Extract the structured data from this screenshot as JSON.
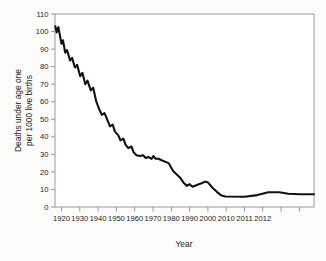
{
  "figure": {
    "y_axis_label_line1": "Deaths under age one",
    "y_axis_label_line2": "per 1000 live births",
    "x_axis_label": "Year"
  },
  "colors": {
    "line": "#121212",
    "axis": "#8f8f8f",
    "plot_background": "#ffffff",
    "text": "#1c1c1c"
  },
  "chart_data": {
    "type": "line",
    "title": "",
    "xlabel": "Year",
    "ylabel": "Deaths under age one per 1000 live births",
    "ylim": [
      0,
      110
    ],
    "y_tick_step": 10,
    "y_ticks": [
      0,
      10,
      20,
      30,
      40,
      50,
      60,
      70,
      80,
      90,
      100,
      110
    ],
    "x_tick_labels": [
      "1920",
      "1930",
      "1940",
      "1950",
      "1960",
      "1970",
      "1980",
      "1990",
      "2000",
      "2010",
      "2011",
      "2012"
    ],
    "extra_unlabeled_x_ticks": 2,
    "legend": "none",
    "grid": "off",
    "axis_note": "decade spacing 1920-2010; final labeled intervals 2011 and 2012 drawn at the same spacing as a decade",
    "points": [
      [
        1916.6,
        103
      ],
      [
        1917.4,
        99.5
      ],
      [
        1918.3,
        102.5
      ],
      [
        1920,
        93
      ],
      [
        1920.8,
        95
      ],
      [
        1922,
        88
      ],
      [
        1923,
        89.5
      ],
      [
        1924.7,
        83.5
      ],
      [
        1925.8,
        85
      ],
      [
        1927.3,
        79.5
      ],
      [
        1928.5,
        81
      ],
      [
        1930.2,
        74.5
      ],
      [
        1931.4,
        76.5
      ],
      [
        1933,
        70
      ],
      [
        1934.2,
        72
      ],
      [
        1936,
        66.5
      ],
      [
        1937.3,
        68
      ],
      [
        1939,
        60
      ],
      [
        1940.5,
        56
      ],
      [
        1942,
        52.5
      ],
      [
        1943.5,
        53.5
      ],
      [
        1945.5,
        48.5
      ],
      [
        1946.5,
        46
      ],
      [
        1948,
        47
      ],
      [
        1949.2,
        43
      ],
      [
        1951,
        41
      ],
      [
        1952.2,
        38
      ],
      [
        1953.8,
        39
      ],
      [
        1955,
        35.5
      ],
      [
        1956.5,
        33.5
      ],
      [
        1958.2,
        34.5
      ],
      [
        1959.5,
        31
      ],
      [
        1961,
        29.5
      ],
      [
        1963,
        29
      ],
      [
        1964.6,
        29.5
      ],
      [
        1966,
        28
      ],
      [
        1967.5,
        28.5
      ],
      [
        1969.3,
        27.5
      ],
      [
        1970.2,
        29
      ],
      [
        1971.5,
        27.5
      ],
      [
        1973,
        27.5
      ],
      [
        1975,
        26.5
      ],
      [
        1978.5,
        25
      ],
      [
        1981,
        20.5
      ],
      [
        1983,
        18.5
      ],
      [
        1985,
        16.5
      ],
      [
        1987,
        13.5
      ],
      [
        1988.6,
        12
      ],
      [
        1990,
        13
      ],
      [
        1991.6,
        11.5
      ],
      [
        1994,
        12.5
      ],
      [
        1996.5,
        13.5
      ],
      [
        1998.5,
        14.5
      ],
      [
        2000,
        14
      ],
      [
        2002.5,
        11
      ],
      [
        2005,
        8.5
      ],
      [
        2007.5,
        6.5
      ],
      [
        2009.5,
        6
      ],
      [
        2011,
        5.8
      ],
      [
        2011.7,
        6.8
      ],
      [
        2012.3,
        8.4
      ],
      [
        2012.9,
        8.4
      ],
      [
        2013.4,
        7.5
      ],
      [
        2014,
        7.3
      ],
      [
        2014.8,
        7.3
      ]
    ]
  }
}
